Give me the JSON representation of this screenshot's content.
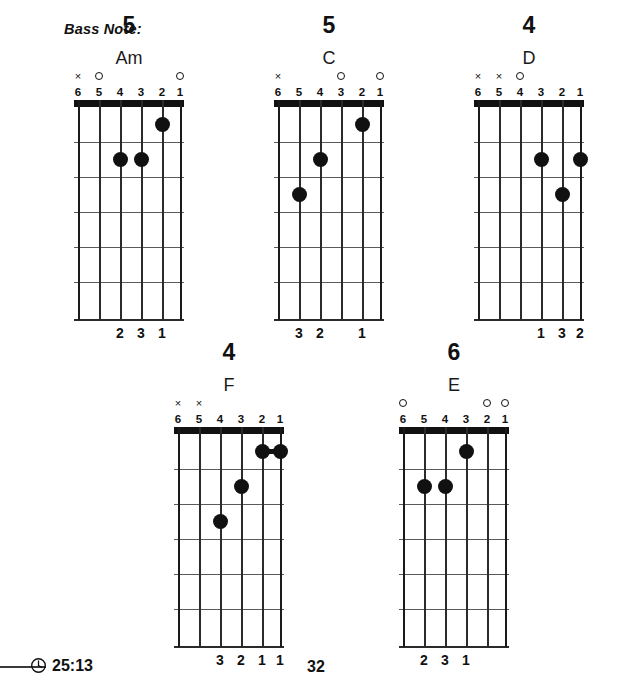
{
  "header": {
    "bass_note_label": "Bass Note:"
  },
  "footer": {
    "timecode": "25:13",
    "page_number": "32",
    "clock_icon": "clock-icon"
  },
  "geometry": {
    "string_xs": [
      4,
      25,
      46,
      67,
      88,
      106
    ],
    "fret_ys": [
      7,
      42,
      77,
      112,
      147,
      182,
      219
    ],
    "dot_ys": [
      24,
      59,
      94,
      129,
      164,
      200
    ]
  },
  "chords": [
    {
      "id": "am",
      "name": "Am",
      "bass_note": "5",
      "left": 59,
      "top": 14,
      "markers": [
        "x",
        "o",
        "",
        "",
        "",
        "o"
      ],
      "string_numbers": [
        "6",
        "5",
        "4",
        "3",
        "2",
        "1"
      ],
      "dots": [
        {
          "string": 2,
          "fret": 1
        },
        {
          "string": 4,
          "fret": 2
        },
        {
          "string": 3,
          "fret": 2
        }
      ],
      "barres": [],
      "fingers": [
        "",
        "",
        "2",
        "3",
        "1",
        ""
      ]
    },
    {
      "id": "c",
      "name": "C",
      "bass_note": "5",
      "left": 259,
      "top": 14,
      "markers": [
        "x",
        "",
        "",
        "o",
        "",
        "o"
      ],
      "string_numbers": [
        "6",
        "5",
        "4",
        "3",
        "2",
        "1"
      ],
      "dots": [
        {
          "string": 2,
          "fret": 1
        },
        {
          "string": 4,
          "fret": 2
        },
        {
          "string": 5,
          "fret": 3
        }
      ],
      "barres": [],
      "fingers": [
        "",
        "3",
        "2",
        "",
        "1",
        ""
      ]
    },
    {
      "id": "d",
      "name": "D",
      "bass_note": "4",
      "left": 459,
      "top": 14,
      "markers": [
        "x",
        "x",
        "o",
        "",
        "",
        ""
      ],
      "string_numbers": [
        "6",
        "5",
        "4",
        "3",
        "2",
        "1"
      ],
      "dots": [
        {
          "string": 3,
          "fret": 2
        },
        {
          "string": 1,
          "fret": 2
        },
        {
          "string": 2,
          "fret": 3
        }
      ],
      "barres": [],
      "fingers": [
        "",
        "",
        "",
        "1",
        "3",
        "2"
      ]
    },
    {
      "id": "f",
      "name": "F",
      "bass_note": "4",
      "left": 159,
      "top": 341,
      "markers": [
        "x",
        "x",
        "",
        "",
        "",
        ""
      ],
      "string_numbers": [
        "6",
        "5",
        "4",
        "3",
        "2",
        "1"
      ],
      "dots": [
        {
          "string": 2,
          "fret": 1
        },
        {
          "string": 1,
          "fret": 1
        },
        {
          "string": 3,
          "fret": 2
        },
        {
          "string": 4,
          "fret": 3
        }
      ],
      "barres": [
        {
          "from_string": 2,
          "to_string": 1,
          "fret": 1
        }
      ],
      "fingers": [
        "",
        "",
        "3",
        "2",
        "1",
        "1"
      ]
    },
    {
      "id": "e",
      "name": "E",
      "bass_note": "6",
      "left": 384,
      "top": 341,
      "markers": [
        "o",
        "",
        "",
        "",
        "o",
        "o"
      ],
      "string_numbers": [
        "6",
        "5",
        "4",
        "3",
        "2",
        "1"
      ],
      "dots": [
        {
          "string": 3,
          "fret": 1
        },
        {
          "string": 5,
          "fret": 2
        },
        {
          "string": 4,
          "fret": 2
        }
      ],
      "barres": [],
      "fingers": [
        "",
        "2",
        "3",
        "1",
        "",
        ""
      ]
    }
  ]
}
